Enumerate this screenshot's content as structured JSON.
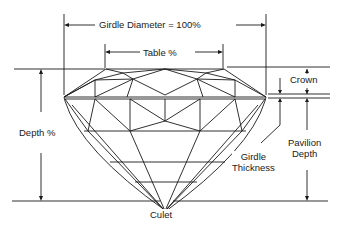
{
  "diagram": {
    "labels": {
      "girdle_diameter": "Girdle Diameter = 100%",
      "table": "Table %",
      "crown": "Crown",
      "depth": "Depth %",
      "pavilion_depth_line1": "Pavilion",
      "pavilion_depth_line2": "Depth",
      "girdle_thickness_line1": "Girdle",
      "girdle_thickness_line2": "Thickness",
      "culet": "Culet"
    },
    "colors": {
      "ink": "#1a1a1a",
      "background": "#ffffff"
    }
  }
}
